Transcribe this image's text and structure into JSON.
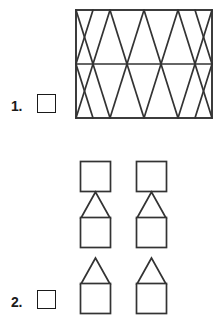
{
  "page": {
    "background_color": "#ffffff",
    "ink_color": "#262626"
  },
  "problems": [
    {
      "number": "1.",
      "answer_box": {
        "value": "",
        "placeholder": ""
      },
      "figure": {
        "name": "diamond-lattice-rectangle",
        "type": "rectangle-with-diagonal-lattice",
        "columns": 4,
        "rows": 2,
        "has_horizontal_midline": true,
        "width_px": 136,
        "height_px": 108,
        "stroke_color": "#333333",
        "fill_color": "#ffffff"
      }
    },
    {
      "number": "2.",
      "answer_box": {
        "value": "",
        "placeholder": ""
      },
      "figure": {
        "name": "square-triangle-chain",
        "type": "two-columns-of-stacked-shapes",
        "columns": 2,
        "sequence": [
          "square",
          "triangle",
          "square",
          "triangle",
          "square"
        ],
        "square_size_px": 30,
        "triangle_height_px": 26,
        "stroke_color": "#333333",
        "fill_color": "#ffffff"
      }
    }
  ]
}
